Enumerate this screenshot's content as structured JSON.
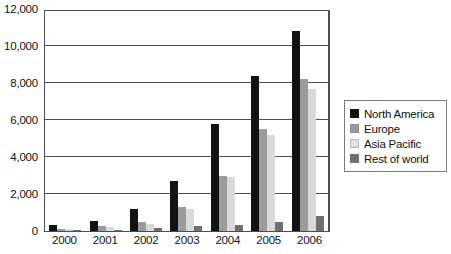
{
  "chart_data": {
    "type": "bar",
    "title": "",
    "subtitle": "",
    "xlabel": "",
    "ylabel": "",
    "categories": [
      "2000",
      "2001",
      "2002",
      "2003",
      "2004",
      "2005",
      "2006"
    ],
    "series": [
      {
        "name": "North America",
        "color": "#121212",
        "values": [
          350,
          550,
          1200,
          2700,
          5800,
          8400,
          10800
        ]
      },
      {
        "name": "Europe",
        "color": "#9b9b9b",
        "values": [
          120,
          250,
          500,
          1300,
          3000,
          5500,
          8200
        ]
      },
      {
        "name": "Asia Pacific",
        "color": "#d9d9d9",
        "values": [
          90,
          200,
          400,
          1200,
          2900,
          5200,
          7700
        ]
      },
      {
        "name": "Rest of world",
        "color": "#6f6f6f",
        "values": [
          40,
          70,
          150,
          250,
          350,
          500,
          800
        ]
      }
    ],
    "ylim": [
      0,
      12000
    ],
    "ytick_labels": [
      "12,000",
      "10,000",
      "8,000",
      "6,000",
      "4,000",
      "2,000",
      "0"
    ],
    "ytick_values": [
      12000,
      10000,
      8000,
      6000,
      4000,
      2000,
      0
    ],
    "gridline_values": [
      10000,
      8000,
      6000,
      4000,
      2000
    ],
    "grid": true,
    "legend_position": "right"
  },
  "legend": {
    "items": [
      {
        "label": "North America",
        "swatch": "legend-swatch-north-america"
      },
      {
        "label": "Europe",
        "swatch": "legend-swatch-europe"
      },
      {
        "label": "Asia Pacific",
        "swatch": "legend-swatch-asia-pacific"
      },
      {
        "label": "Rest of world",
        "swatch": "legend-swatch-rest-of-world"
      }
    ]
  }
}
